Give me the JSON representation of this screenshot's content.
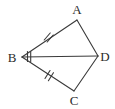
{
  "figure": {
    "type": "geometry-diagram",
    "background_color": "#ffffff",
    "stroke_color": "#3a3a3a",
    "label_color": "#2b2b2b",
    "stroke_width": 1.1,
    "vertices": [
      {
        "id": "A",
        "label": "A",
        "x": 77,
        "y": 20,
        "label_x": 77,
        "label_y": 14
      },
      {
        "id": "B",
        "label": "B",
        "x": 22,
        "y": 57,
        "label_x": 12,
        "label_y": 62
      },
      {
        "id": "C",
        "label": "C",
        "x": 74,
        "y": 91,
        "label_x": 74,
        "label_y": 105
      },
      {
        "id": "D",
        "label": "D",
        "x": 98,
        "y": 56,
        "label_x": 105,
        "label_y": 61
      }
    ],
    "edges": [
      {
        "id": "AB",
        "from": "A",
        "to": "B",
        "ticks": 2
      },
      {
        "id": "BC",
        "from": "B",
        "to": "C",
        "ticks": 2
      },
      {
        "id": "AD",
        "from": "A",
        "to": "D",
        "ticks": 0
      },
      {
        "id": "DC",
        "from": "D",
        "to": "C",
        "ticks": 0
      },
      {
        "id": "BD",
        "from": "B",
        "to": "D",
        "ticks": 2,
        "tick_position": 0.13
      }
    ],
    "tick_marks": {
      "ab": {
        "count": 2,
        "center_x": 48,
        "center_y": 35
      },
      "bc": {
        "count": 2,
        "center_x": 49,
        "center_y": 75
      },
      "bd": {
        "count": 2,
        "center_x": 29,
        "center_y": 56
      }
    }
  }
}
